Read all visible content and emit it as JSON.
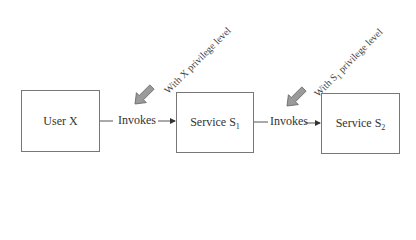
{
  "diagram": {
    "nodes": [
      {
        "id": "user-x",
        "label": "User X"
      },
      {
        "id": "service-s1",
        "label": "Service S",
        "subscript": "1"
      },
      {
        "id": "service-s2",
        "label": "Service S",
        "subscript": "2"
      }
    ],
    "edges": [
      {
        "from": "user-x",
        "to": "service-s1",
        "label": "Invokes",
        "annotation": "With X privilege level"
      },
      {
        "from": "service-s1",
        "to": "service-s2",
        "label": "Invokes",
        "annotation_prefix": "With S",
        "annotation_subscript": "1",
        "annotation_suffix": " privilege level"
      }
    ],
    "colors": {
      "box_border": "#777777",
      "text": "#333333",
      "callout_arrow_fill": "#9a9a9a",
      "callout_arrow_stroke": "#666666"
    }
  }
}
